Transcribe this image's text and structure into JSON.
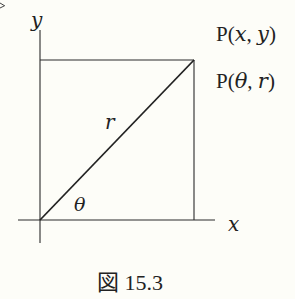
{
  "figure": {
    "caption": "図 15.3",
    "axes": {
      "x_label": "x",
      "y_label": "y"
    },
    "point_labels": {
      "cartesian": {
        "prefix": "P",
        "open": "(",
        "a": "x",
        "sep": ", ",
        "b": "y",
        "close": ")"
      },
      "polar": {
        "prefix": "P",
        "open": "(",
        "a": "θ",
        "sep": ", ",
        "b": "r",
        "close": ")"
      }
    },
    "segment_label": "r",
    "angle_label": "θ",
    "colors": {
      "line": "#2a2a2a",
      "background": "#fdfdf8"
    }
  }
}
